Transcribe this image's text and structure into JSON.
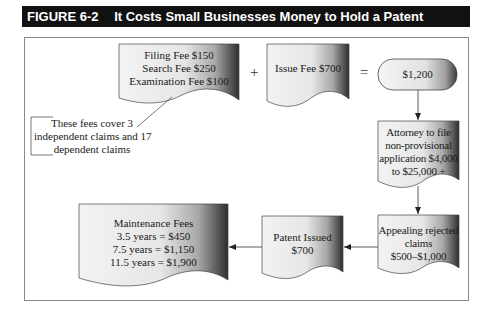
{
  "figure": {
    "label": "FIGURE 6-2",
    "title": "It Costs Small Businesses Money to Hold a Patent"
  },
  "nodes": {
    "initial_fees": {
      "shape": "document",
      "lines": [
        "Filing Fee $150",
        "Search Fee $250",
        "Examination Fee $100"
      ]
    },
    "issue_fee": {
      "shape": "document",
      "lines": [
        "Issue Fee $700"
      ]
    },
    "total": {
      "shape": "terminator",
      "lines": [
        "$1,200"
      ]
    },
    "attorney": {
      "shape": "document",
      "lines": [
        "Attorney to file",
        "non-provisional",
        "application $4,000",
        "to $25,000 +"
      ]
    },
    "appealing": {
      "shape": "document",
      "lines": [
        "Appealing rejected",
        "claims",
        "$500–$1,000"
      ]
    },
    "patent_issued": {
      "shape": "document",
      "lines": [
        "Patent Issued",
        "$700"
      ]
    },
    "maintenance": {
      "shape": "document",
      "lines": [
        "Maintenance Fees",
        "3.5 years = $450",
        "7.5 years = $1,150",
        "11.5 years = $1,900"
      ]
    }
  },
  "operators": {
    "plus": "+",
    "equals": "="
  },
  "annotation": {
    "lines": [
      "These fees cover 3",
      "independent claims and 17",
      "dependent claims"
    ],
    "target": "initial_fees"
  },
  "edges": [
    {
      "from": "total",
      "to": "attorney"
    },
    {
      "from": "attorney",
      "to": "appealing"
    },
    {
      "from": "appealing",
      "to": "patent_issued"
    },
    {
      "from": "patent_issued",
      "to": "maintenance"
    }
  ],
  "colors": {
    "title_bg": "#111111",
    "title_text": "#ffffff",
    "frame": "#8a8a8a",
    "shape_light": "#f2f2f2",
    "shape_dark": "#2e2e2e",
    "line": "#333333"
  }
}
